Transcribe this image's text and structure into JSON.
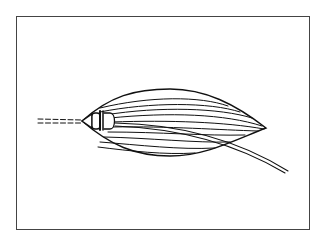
{
  "figure": {
    "colors": {
      "stroke": "#111111",
      "frame": "#444444",
      "background": "#ffffff"
    },
    "parts": [
      "frame",
      "leaf-outline",
      "fiber-lines",
      "capsule-node",
      "dashed-lead",
      "tail-strand"
    ]
  }
}
